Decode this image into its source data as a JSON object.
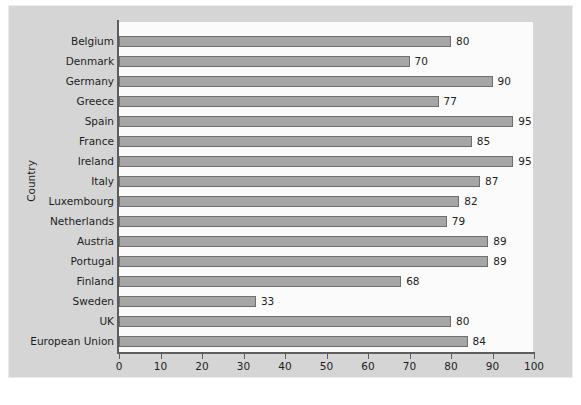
{
  "chart_data": {
    "type": "bar",
    "orientation": "horizontal",
    "title": "",
    "xlabel": "",
    "ylabel": "Country",
    "xlim": [
      0,
      100
    ],
    "xticks": [
      0,
      10,
      20,
      30,
      40,
      50,
      60,
      70,
      80,
      90,
      100
    ],
    "xtick_labels": [
      "0",
      "10",
      "20",
      "30",
      "40",
      "50",
      "60",
      "70",
      "80",
      "90",
      "100"
    ],
    "grid": false,
    "legend": null,
    "bar_color": "#a6a6a6",
    "bar_edge_color": "#6e6e6e",
    "plot_background": "#fbfbfb",
    "figure_background": "#d5d5d5",
    "categories": [
      "Belgium",
      "Denmark",
      "Germany",
      "Greece",
      "Spain",
      "France",
      "Ireland",
      "Italy",
      "Luxembourg",
      "Netherlands",
      "Austria",
      "Portugal",
      "Finland",
      "Sweden",
      "UK",
      "European Union"
    ],
    "values": [
      80,
      70,
      90,
      77,
      95,
      85,
      95,
      87,
      82,
      79,
      89,
      89,
      68,
      33,
      80,
      84
    ],
    "data_labels": [
      "80",
      "70",
      "90",
      "77",
      "95",
      "85",
      "95",
      "87",
      "82",
      "79",
      "89",
      "89",
      "68",
      "33",
      "80",
      "84"
    ]
  }
}
